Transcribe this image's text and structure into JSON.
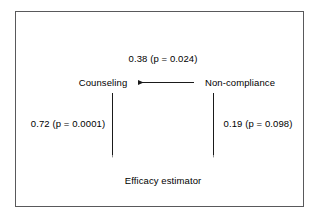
{
  "figure": {
    "type": "path-diagram",
    "background_color": "#ffffff",
    "border_color": "#59595b",
    "text_color": "#000000"
  },
  "nodes": [
    {
      "id": "counseling",
      "label": "Counseling"
    },
    {
      "id": "noncompliance",
      "label": "Non-compliance"
    },
    {
      "id": "efficacy",
      "label": "Efficacy estimator"
    }
  ],
  "edges": [
    {
      "id": "noncompliance-to-counseling",
      "from": "Non-compliance",
      "to": "Counseling",
      "direction": "left",
      "coefficient": "0.38",
      "p_value": "0.024",
      "label": "0.38 (p = 0.024)"
    },
    {
      "id": "counseling-to-efficacy",
      "from": "Counseling",
      "to": "Efficacy estimator",
      "direction": "down",
      "coefficient": "0.72",
      "p_value": "0.0001",
      "label": "0.72 (p = 0.0001)"
    },
    {
      "id": "noncompliance-to-efficacy",
      "from": "Non-compliance",
      "to": "Efficacy estimator",
      "direction": "down",
      "coefficient": "0.19",
      "p_value": "0.098",
      "label": "0.19 (p = 0.098)"
    }
  ]
}
